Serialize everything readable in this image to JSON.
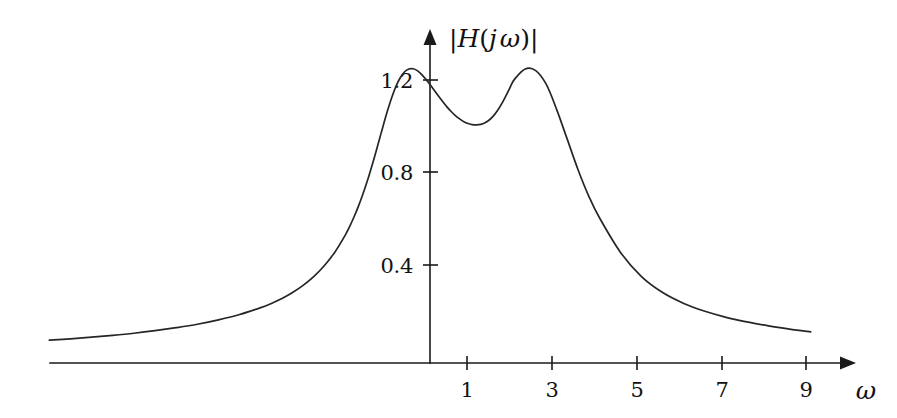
{
  "figure": {
    "background_color": "#ffffff",
    "ink_color": "#1a1a1a",
    "curve_color": "#262626"
  },
  "chart_data": {
    "type": "line",
    "title": "",
    "subtitle": "",
    "xlabel": "ω",
    "ylabel": "|H(jω)|",
    "ylabel_parts": {
      "bar_left": "|",
      "h": "H",
      "paren_open": "(",
      "j": "j",
      "omega": "ω",
      "paren_close": ")",
      "bar_right": "|"
    },
    "grid": false,
    "legend": null,
    "legend_position": "none",
    "annotations": [],
    "xlim": [
      -9.0,
      9.8
    ],
    "ylim": [
      0,
      1.38
    ],
    "xticks": [
      1,
      3,
      5,
      7,
      9
    ],
    "xtick_labels": [
      "1",
      "3",
      "5",
      "7",
      "9"
    ],
    "yticks": [
      0.4,
      0.8,
      1.2
    ],
    "ytick_labels": [
      "0.4",
      "0.8",
      "1.2"
    ],
    "x_axis_visible_range": [
      -9.0,
      9.8
    ],
    "y_axis_origin_value": 0,
    "series": [
      {
        "name": "|H(jω)|",
        "x": [
          -9.0,
          -8.5,
          -8.0,
          -7.5,
          -7.0,
          -6.5,
          -6.0,
          -5.5,
          -5.0,
          -4.5,
          -4.0,
          -3.75,
          -3.5,
          -3.25,
          -3.0,
          -2.75,
          -2.5,
          -2.25,
          -2.0,
          -1.9,
          -1.8,
          -1.7,
          -1.6,
          -1.5,
          -1.4,
          -1.3,
          -1.2,
          -1.1,
          -1.0,
          -0.9,
          -0.8,
          -0.7,
          -0.6,
          -0.5,
          -0.4,
          -0.3,
          -0.2,
          -0.1,
          0.0,
          0.1,
          0.2,
          0.3,
          0.4,
          0.5,
          0.6,
          0.7,
          0.8,
          0.9,
          1.0,
          1.1,
          1.2,
          1.3,
          1.4,
          1.5,
          1.6,
          1.7,
          1.8,
          1.9,
          2.0,
          2.25,
          2.5,
          2.75,
          3.0,
          3.25,
          3.5,
          3.75,
          4.0,
          4.5,
          5.0,
          5.5,
          6.0,
          6.5,
          7.0,
          7.5,
          8.0,
          8.5,
          9.0
        ],
        "y": [
          0.075,
          0.081,
          0.088,
          0.096,
          0.105,
          0.116,
          0.129,
          0.144,
          0.163,
          0.186,
          0.216,
          0.234,
          0.255,
          0.281,
          0.312,
          0.35,
          0.397,
          0.456,
          0.531,
          0.567,
          0.607,
          0.651,
          0.7,
          0.754,
          0.813,
          0.876,
          0.942,
          1.008,
          1.071,
          1.128,
          1.176,
          1.212,
          1.237,
          1.249,
          1.25,
          1.242,
          1.226,
          1.205,
          1.182,
          1.157,
          1.132,
          1.108,
          1.085,
          1.065,
          1.047,
          1.033,
          1.021,
          1.013,
          1.008,
          1.007,
          1.009,
          1.016,
          1.028,
          1.046,
          1.07,
          1.1,
          1.135,
          1.172,
          1.205,
          1.249,
          1.242,
          1.182,
          1.071,
          0.942,
          0.813,
          0.7,
          0.607,
          0.456,
          0.35,
          0.281,
          0.234,
          0.2,
          0.174,
          0.154,
          0.137,
          0.123,
          0.111
        ],
        "color": "#262626",
        "style": "solid"
      }
    ]
  }
}
